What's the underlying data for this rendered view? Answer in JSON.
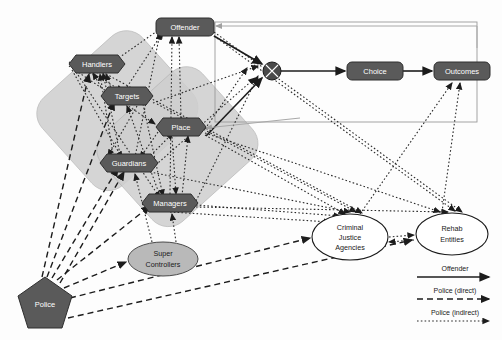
{
  "diagram": {
    "colors": {
      "node_fill": "#5a5a5a",
      "node_stroke": "#2f2f2f",
      "cluster_fill": "#cfcfcf",
      "line_dark": "#1c1c1c",
      "ellipse_gray": "#b9b9b9",
      "box_outline": "#9a9a9a"
    },
    "hex_nodes": [
      {
        "id": "handlers",
        "label": "Handlers",
        "cx": 97,
        "cy": 64,
        "w": 56,
        "h": 19
      },
      {
        "id": "targets",
        "label": "Targets",
        "cx": 127,
        "cy": 96,
        "w": 52,
        "h": 19
      },
      {
        "id": "place",
        "label": "Place",
        "cx": 181,
        "cy": 127,
        "w": 50,
        "h": 19
      },
      {
        "id": "guardians",
        "label": "Guardians",
        "cx": 129,
        "cy": 163,
        "w": 58,
        "h": 19
      },
      {
        "id": "managers",
        "label": "Managers",
        "cx": 170,
        "cy": 203,
        "w": 56,
        "h": 19
      }
    ],
    "rect_nodes": [
      {
        "id": "offender",
        "label": "Offender",
        "cx": 185,
        "cy": 27,
        "w": 58,
        "h": 18
      },
      {
        "id": "choice",
        "label": "Choice",
        "cx": 375,
        "cy": 71,
        "w": 56,
        "h": 18
      },
      {
        "id": "outcomes",
        "label": "Outcomes",
        "cx": 462,
        "cy": 71,
        "w": 56,
        "h": 18
      }
    ],
    "ellipse_nodes": [
      {
        "id": "super-controllers",
        "label_lines": [
          "Super",
          "Controllers"
        ],
        "cx": 163,
        "cy": 259,
        "rx": 35,
        "ry": 17,
        "style": "gray"
      },
      {
        "id": "criminal-justice-agencies",
        "label_lines": [
          "Criminal",
          "Justice",
          "Agencies"
        ],
        "cx": 350,
        "cy": 237,
        "rx": 38,
        "ry": 23,
        "style": "white"
      },
      {
        "id": "rehab-entities",
        "label_lines": [
          "Rehab",
          "Entities"
        ],
        "cx": 452,
        "cy": 234,
        "rx": 36,
        "ry": 21,
        "style": "white"
      }
    ],
    "junction": {
      "id": "crossed-circle-junction",
      "cx": 272,
      "cy": 71,
      "r": 9
    },
    "police": {
      "id": "police",
      "label": "Police",
      "cx": 45,
      "cy": 304,
      "r": 27
    },
    "legend": {
      "title": "",
      "items": [
        {
          "id": "legend-offender",
          "label": "Offender",
          "style": "solid"
        },
        {
          "id": "legend-police-direct",
          "label": "Police (direct)",
          "style": "dashed"
        },
        {
          "id": "legend-police-indirect",
          "label": "Police (indirect)",
          "style": "dotted"
        }
      ]
    }
  }
}
